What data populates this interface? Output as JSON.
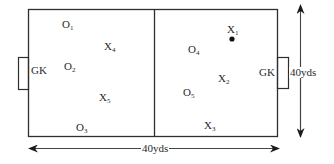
{
  "diagram": {
    "type": "soccer-drill-field",
    "colors": {
      "line": "#2e2e2e",
      "text": "#2a2a2a",
      "background": "#ffffff"
    },
    "dimensions": {
      "width_label": "40yds",
      "height_label": "40yds"
    },
    "goalkeepers": [
      {
        "id": "gk-left",
        "label": "GK"
      },
      {
        "id": "gk-right",
        "label": "GK"
      }
    ],
    "players": [
      {
        "id": "O1",
        "base": "O",
        "sub": "1"
      },
      {
        "id": "O2",
        "base": "O",
        "sub": "2"
      },
      {
        "id": "O3",
        "base": "O",
        "sub": "3"
      },
      {
        "id": "O4",
        "base": "O",
        "sub": "4"
      },
      {
        "id": "O5",
        "base": "O",
        "sub": "5"
      },
      {
        "id": "X1",
        "base": "X",
        "sub": "1",
        "has_ball": true
      },
      {
        "id": "X2",
        "base": "X",
        "sub": "2"
      },
      {
        "id": "X3",
        "base": "X",
        "sub": "3"
      },
      {
        "id": "X4",
        "base": "X",
        "sub": "4"
      },
      {
        "id": "X5",
        "base": "X",
        "sub": "5"
      }
    ]
  }
}
